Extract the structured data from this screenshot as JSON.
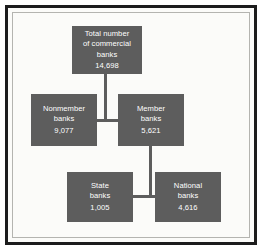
{
  "figure": {
    "frame_color": "#1c1c1c",
    "inner_rule_color": "#b4b4b0",
    "node_fill": "#5d5d5d",
    "node_text_color": "#ffffff",
    "background": "#fbfbf9"
  },
  "chart_data": {
    "type": "diagram",
    "title": "Total number of commercial banks",
    "nodes": [
      {
        "id": "total",
        "label_lines": [
          "Total number",
          "of commercial",
          "banks"
        ],
        "value": "14,698",
        "value_number": 14698,
        "level": 0
      },
      {
        "id": "nonmember",
        "label_lines": [
          "Nonmember",
          "banks"
        ],
        "value": "9,077",
        "value_number": 9077,
        "level": 1
      },
      {
        "id": "member",
        "label_lines": [
          "Member",
          "banks"
        ],
        "value": "5,621",
        "value_number": 5621,
        "level": 1
      },
      {
        "id": "state",
        "label_lines": [
          "State",
          "banks"
        ],
        "value": "1,005",
        "value_number": 1005,
        "level": 2
      },
      {
        "id": "national",
        "label_lines": [
          "National",
          "banks"
        ],
        "value": "4,616",
        "value_number": 4616,
        "level": 2
      }
    ],
    "edges": [
      {
        "from": "total",
        "to": "nonmember"
      },
      {
        "from": "total",
        "to": "member"
      },
      {
        "from": "member",
        "to": "state"
      },
      {
        "from": "member",
        "to": "national"
      }
    ]
  },
  "nodes": {
    "total": {
      "line1": "Total number",
      "line2": "of commercial",
      "line3": "banks",
      "value": "14,698"
    },
    "nonmember": {
      "line1": "Nonmember",
      "line2": "banks",
      "value": "9,077"
    },
    "member": {
      "line1": "Member",
      "line2": "banks",
      "value": "5,621"
    },
    "state": {
      "line1": "State",
      "line2": "banks",
      "value": "1,005"
    },
    "national": {
      "line1": "National",
      "line2": "banks",
      "value": "4,616"
    }
  }
}
